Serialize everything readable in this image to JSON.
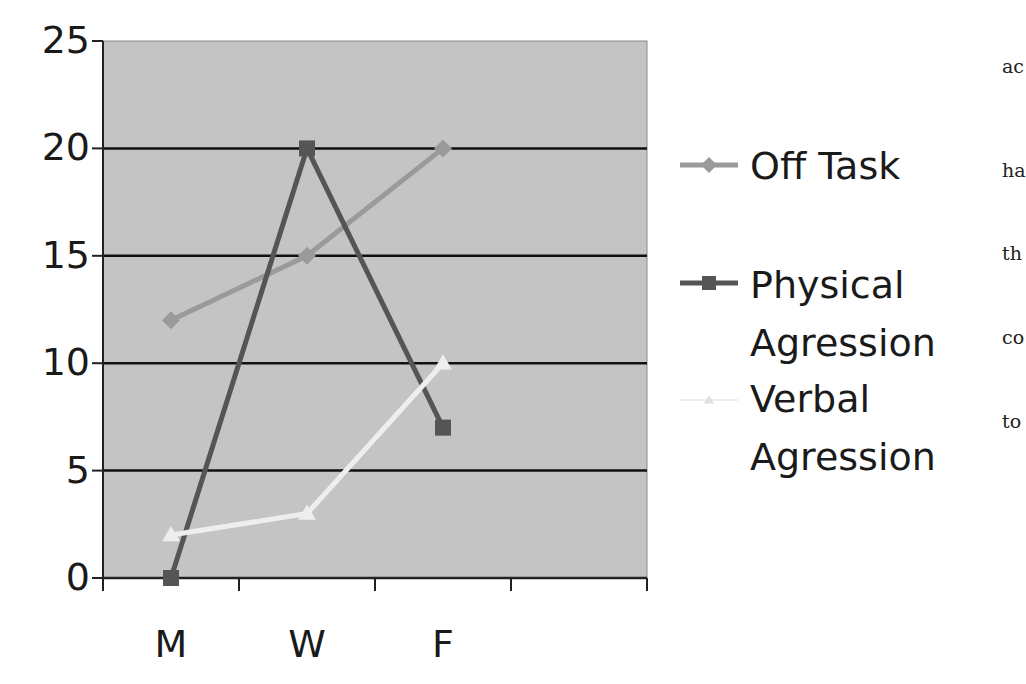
{
  "chart_data": {
    "type": "line",
    "title": "",
    "xlabel": "",
    "ylabel": "",
    "categories": [
      "M",
      "W",
      "F"
    ],
    "ylim": [
      0,
      25
    ],
    "yticks": [
      "0",
      "5",
      "10",
      "15",
      "20",
      "25"
    ],
    "grid": true,
    "legend_position": "right",
    "plot_background": "#c4c4c4",
    "series": [
      {
        "name": "Off Task",
        "values": [
          12,
          15,
          20
        ],
        "color": "#9a9a9a",
        "marker": "diamond"
      },
      {
        "name": "Physical Agression",
        "values": [
          0,
          20,
          7
        ],
        "color": "#555555",
        "marker": "square"
      },
      {
        "name": "Verbal Agression",
        "values": [
          2,
          3,
          10
        ],
        "color": "#eeeeee",
        "marker": "triangle"
      }
    ]
  },
  "legend": {
    "items": [
      {
        "line1": "Off Task",
        "line2": ""
      },
      {
        "line1": "Physical",
        "line2": "Agression"
      },
      {
        "line1": "Verbal",
        "line2": "Agression"
      }
    ]
  },
  "side_text": [
    "ac",
    "ha",
    "th",
    "co",
    "to"
  ]
}
